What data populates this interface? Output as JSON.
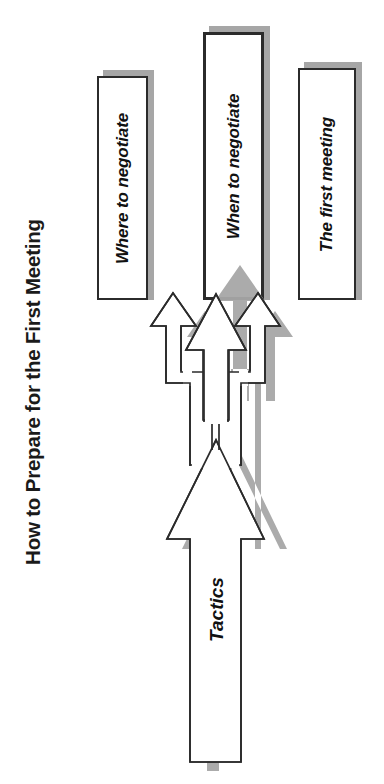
{
  "page": {
    "title": "How to Prepare for the First Meeting",
    "background_color": "#ffffff",
    "text_color": "#1a1a1a",
    "shadow_color": "#a6a6a6",
    "outline_color": "#2b2b2b",
    "fill_color": "#ffffff",
    "width": 384,
    "height": 784
  },
  "diagram": {
    "type": "split-arrow-process",
    "orientation": "rotated-90-ccw",
    "source": {
      "label": "Tactics",
      "shape": "split-arrow",
      "branch_count": 3
    },
    "branches": [
      {
        "id": "where",
        "label": "Where to negotiate",
        "position": "left"
      },
      {
        "id": "when",
        "label": "When to negotiate",
        "position": "center"
      },
      {
        "id": "first",
        "label": "The first meeting",
        "position": "right"
      }
    ]
  }
}
